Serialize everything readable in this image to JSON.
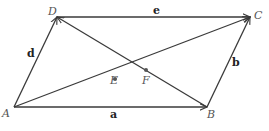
{
  "diagram": {
    "points": {
      "A": {
        "label": "A",
        "x": 14,
        "y": 107
      },
      "B": {
        "label": "B",
        "x": 207,
        "y": 107
      },
      "C": {
        "label": "C",
        "x": 250,
        "y": 17
      },
      "D": {
        "label": "D",
        "x": 57,
        "y": 17
      },
      "E": {
        "label": "E",
        "x": 113,
        "y": 80
      },
      "F": {
        "label": "F",
        "x": 145,
        "y": 70
      }
    },
    "vectors": {
      "a": {
        "label": "a",
        "from": "A",
        "to": "B"
      },
      "b": {
        "label": "b",
        "from": "B",
        "to": "C"
      },
      "d": {
        "label": "d",
        "from": "A",
        "to": "D"
      },
      "e": {
        "label": "e",
        "from": "D",
        "to": "C"
      },
      "AC": {
        "label": "",
        "from": "A",
        "to": "C"
      },
      "BD": {
        "label": "",
        "from": "B",
        "to": "D"
      }
    },
    "colors": {
      "stroke": "#3a3a3a",
      "label": "#555555"
    }
  }
}
